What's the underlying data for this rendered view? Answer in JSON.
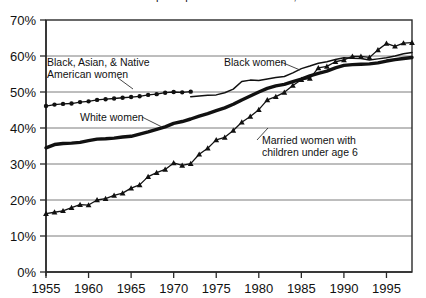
{
  "chart_data": {
    "type": "line",
    "title": "Labor force participation rates of women, 1955–1998",
    "xlabel": "",
    "ylabel": "",
    "xlim": [
      1955,
      1998
    ],
    "ylim": [
      0,
      70
    ],
    "grid": true,
    "legend_position": "inline-annotations",
    "y_ticks": [
      "0%",
      "10%",
      "20%",
      "30%",
      "40%",
      "50%",
      "60%",
      "70%"
    ],
    "y_tick_values": [
      0,
      10,
      20,
      30,
      40,
      50,
      60,
      70
    ],
    "x_ticks": [
      "1955",
      "1960",
      "1965",
      "1970",
      "1975",
      "1980",
      "1985",
      "1990",
      "1995"
    ],
    "x_tick_values": [
      1955,
      1960,
      1965,
      1970,
      1975,
      1980,
      1985,
      1990,
      1995
    ],
    "series": [
      {
        "name": "Black, Asian, & Native American women",
        "marker": "circle",
        "style": "thin-marked",
        "x": [
          1955,
          1956,
          1957,
          1958,
          1959,
          1960,
          1961,
          1962,
          1963,
          1964,
          1965,
          1966,
          1967,
          1968,
          1969,
          1970,
          1971,
          1972
        ],
        "values": [
          46.1,
          46.5,
          46.7,
          46.8,
          47.2,
          47.4,
          47.8,
          48.0,
          48.2,
          48.4,
          48.6,
          48.8,
          49.2,
          49.4,
          49.8,
          50.0,
          49.9,
          50.1
        ]
      },
      {
        "name": "Black women",
        "marker": "none",
        "style": "thin",
        "x": [
          1972,
          1973,
          1974,
          1975,
          1976,
          1977,
          1978,
          1979,
          1980,
          1981,
          1982,
          1983,
          1984,
          1985,
          1986,
          1987,
          1988,
          1989,
          1990,
          1991,
          1992,
          1993,
          1994,
          1995,
          1996,
          1997,
          1998
        ],
        "values": [
          48.7,
          48.9,
          49.1,
          49.2,
          49.8,
          50.8,
          52.9,
          53.3,
          53.2,
          53.6,
          54.0,
          54.3,
          55.3,
          56.5,
          57.2,
          58.0,
          58.4,
          59.0,
          59.5,
          59.4,
          59.3,
          58.9,
          59.2,
          59.5,
          60.0,
          60.6,
          61.0
        ]
      },
      {
        "name": "White women",
        "marker": "none",
        "style": "thick",
        "x": [
          1955,
          1956,
          1957,
          1958,
          1959,
          1960,
          1961,
          1962,
          1963,
          1964,
          1965,
          1966,
          1967,
          1968,
          1969,
          1970,
          1971,
          1972,
          1973,
          1974,
          1975,
          1976,
          1977,
          1978,
          1979,
          1980,
          1981,
          1982,
          1983,
          1984,
          1985,
          1986,
          1987,
          1988,
          1989,
          1990,
          1991,
          1992,
          1993,
          1994,
          1995,
          1996,
          1997,
          1998
        ],
        "values": [
          34.5,
          35.4,
          35.7,
          35.8,
          36.0,
          36.5,
          36.9,
          37.0,
          37.2,
          37.5,
          37.7,
          38.3,
          38.9,
          39.6,
          40.3,
          41.3,
          41.8,
          42.5,
          43.3,
          44.0,
          44.8,
          45.6,
          46.6,
          47.8,
          48.9,
          50.0,
          51.0,
          51.7,
          52.1,
          52.9,
          53.6,
          54.5,
          55.2,
          55.8,
          56.7,
          57.4,
          57.6,
          57.7,
          57.8,
          58.1,
          58.6,
          59.0,
          59.3,
          59.6
        ]
      },
      {
        "name": "Married women with children under age 6",
        "marker": "triangle",
        "style": "thin-marked",
        "x": [
          1955,
          1956,
          1957,
          1958,
          1959,
          1960,
          1961,
          1962,
          1963,
          1964,
          1965,
          1966,
          1967,
          1968,
          1969,
          1970,
          1971,
          1972,
          1973,
          1974,
          1975,
          1976,
          1977,
          1978,
          1979,
          1980,
          1981,
          1982,
          1983,
          1984,
          1985,
          1986,
          1987,
          1988,
          1989,
          1990,
          1991,
          1992,
          1993,
          1994,
          1995,
          1996,
          1997,
          1998
        ],
        "values": [
          16.2,
          16.6,
          17.0,
          17.9,
          18.7,
          18.6,
          20.0,
          20.4,
          21.3,
          21.9,
          23.3,
          24.2,
          26.5,
          27.6,
          28.5,
          30.3,
          29.6,
          30.1,
          32.7,
          34.4,
          36.7,
          37.4,
          39.3,
          41.6,
          43.2,
          45.1,
          47.8,
          48.7,
          49.9,
          51.8,
          53.4,
          53.8,
          56.7,
          57.1,
          58.4,
          58.9,
          59.9,
          59.9,
          59.6,
          61.7,
          63.5,
          62.7,
          63.6,
          63.7
        ]
      }
    ],
    "annotations": [
      {
        "id": "annot-black-asian-native",
        "line1": "Black, Asian, & Native",
        "line2": "American women"
      },
      {
        "id": "annot-black-women",
        "line1": "Black women",
        "line2": ""
      },
      {
        "id": "annot-white-women",
        "line1": "White women",
        "line2": ""
      },
      {
        "id": "annot-married-women",
        "line1": "Married women with",
        "line2": "children under age 6"
      }
    ]
  },
  "colors": {
    "ink": "#111111",
    "grid": "#6d6d6d",
    "frame": "#2a2a2a",
    "background": "#ffffff"
  }
}
